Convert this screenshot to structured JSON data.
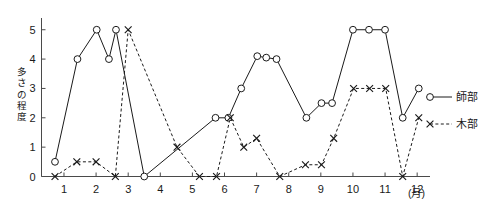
{
  "chart_data": {
    "type": "line",
    "title": "",
    "xlabel": "(月)",
    "ylabel": "多さの程度",
    "xlim": [
      0.3,
      12.4
    ],
    "ylim": [
      0,
      5.4
    ],
    "grid": false,
    "legend_position": "right",
    "x_tick_labels": [
      "1",
      "2",
      "3",
      "4",
      "5",
      "6",
      "7",
      "8",
      "9",
      "10",
      "11",
      "12"
    ],
    "x_ticks": [
      1,
      2,
      3,
      4,
      5,
      6,
      7,
      8,
      9,
      10,
      11,
      12
    ],
    "y_tick_labels": [
      "0",
      "1",
      "2",
      "3",
      "4",
      "5"
    ],
    "y_ticks": [
      0,
      1,
      2,
      3,
      4,
      5
    ],
    "x_unit_label": "(月)",
    "y_axis_label_chars": [
      "多",
      "さ",
      "の",
      "程",
      "度"
    ],
    "series": [
      {
        "name": "師部",
        "marker": "circle",
        "line_style": "solid",
        "color": "#1a1a1a",
        "points": [
          [
            0.72,
            0.5
          ],
          [
            1.42,
            4.0
          ],
          [
            2.02,
            5.0
          ],
          [
            2.4,
            4.0
          ],
          [
            2.62,
            5.0
          ],
          [
            3.5,
            0.0
          ],
          [
            5.72,
            2.0
          ],
          [
            6.12,
            2.0
          ],
          [
            6.52,
            3.0
          ],
          [
            7.02,
            4.1
          ],
          [
            7.3,
            4.05
          ],
          [
            7.62,
            4.0
          ],
          [
            8.55,
            2.0
          ],
          [
            9.02,
            2.5
          ],
          [
            9.35,
            2.5
          ],
          [
            10.0,
            5.0
          ],
          [
            10.5,
            5.0
          ],
          [
            11.0,
            5.0
          ],
          [
            11.55,
            2.0
          ],
          [
            12.05,
            3.0
          ]
        ]
      },
      {
        "name": "木部",
        "marker": "cross",
        "line_style": "dotted",
        "color": "#1a1a1a",
        "points": [
          [
            0.72,
            0.0
          ],
          [
            1.4,
            0.5
          ],
          [
            2.0,
            0.5
          ],
          [
            2.6,
            0.0
          ],
          [
            3.0,
            5.0
          ],
          [
            4.52,
            1.0
          ],
          [
            5.22,
            0.0
          ],
          [
            5.75,
            0.0
          ],
          [
            6.18,
            2.0
          ],
          [
            6.6,
            1.0
          ],
          [
            7.0,
            1.3
          ],
          [
            7.72,
            0.0
          ],
          [
            8.52,
            0.4
          ],
          [
            9.02,
            0.4
          ],
          [
            9.4,
            1.3
          ],
          [
            10.02,
            3.0
          ],
          [
            10.52,
            3.0
          ],
          [
            11.02,
            3.0
          ],
          [
            11.55,
            0.0
          ],
          [
            12.05,
            2.0
          ]
        ]
      }
    ],
    "legend": [
      {
        "label": "師部",
        "marker": "circle",
        "line_style": "solid"
      },
      {
        "label": "木部",
        "marker": "cross",
        "line_style": "dotted"
      }
    ]
  }
}
